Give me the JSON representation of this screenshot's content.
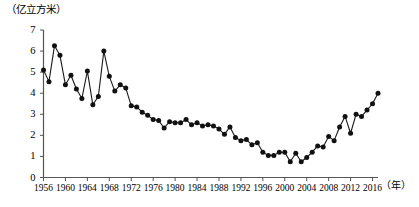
{
  "chart_data": {
    "type": "line",
    "title": "",
    "subtitle": "",
    "unit_label": "（亿立方米）",
    "xlabel": "（年）",
    "ylabel": "",
    "ylim": [
      0,
      7
    ],
    "xlim": [
      1956,
      2017
    ],
    "grid": false,
    "legend": "none",
    "marker": "filled-circle",
    "y_ticks": [
      "0",
      "1",
      "2",
      "3",
      "4",
      "5",
      "6",
      "7"
    ],
    "x_ticks": [
      "1956",
      "1960",
      "1964",
      "1968",
      "1972",
      "1976",
      "1980",
      "1984",
      "1988",
      "1992",
      "1996",
      "2000",
      "2004",
      "2008",
      "2012",
      "2016"
    ],
    "x": [
      1956,
      1957,
      1958,
      1959,
      1960,
      1961,
      1962,
      1963,
      1964,
      1965,
      1966,
      1967,
      1968,
      1969,
      1970,
      1971,
      1972,
      1973,
      1974,
      1975,
      1976,
      1977,
      1978,
      1979,
      1980,
      1981,
      1982,
      1983,
      1984,
      1985,
      1986,
      1987,
      1988,
      1989,
      1990,
      1991,
      1992,
      1993,
      1994,
      1995,
      1996,
      1997,
      1998,
      1999,
      2000,
      2001,
      2002,
      2003,
      2004,
      2005,
      2006,
      2007,
      2008,
      2009,
      2010,
      2011,
      2012,
      2013,
      2014,
      2015,
      2016,
      2017
    ],
    "values": [
      5.1,
      4.55,
      6.25,
      5.8,
      4.4,
      4.85,
      4.2,
      3.75,
      5.05,
      3.45,
      3.85,
      6.0,
      4.8,
      4.1,
      4.4,
      4.25,
      3.4,
      3.35,
      3.1,
      2.95,
      2.75,
      2.7,
      2.35,
      2.65,
      2.6,
      2.6,
      2.75,
      2.5,
      2.6,
      2.45,
      2.5,
      2.45,
      2.3,
      2.05,
      2.4,
      1.9,
      1.75,
      1.8,
      1.55,
      1.65,
      1.2,
      1.05,
      1.05,
      1.2,
      1.2,
      0.75,
      1.15,
      0.75,
      0.95,
      1.2,
      1.5,
      1.45,
      1.95,
      1.75,
      2.4,
      2.9,
      2.1,
      3.0,
      2.9,
      3.2,
      3.5,
      4.0
    ],
    "series_name": "年径流量",
    "annotations": []
  }
}
